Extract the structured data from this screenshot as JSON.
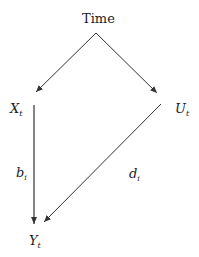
{
  "diagram": {
    "nodes": [
      {
        "id": "time",
        "label": "Time"
      },
      {
        "id": "x",
        "label": "X",
        "sub": "t"
      },
      {
        "id": "u",
        "label": "U",
        "sub": "t"
      },
      {
        "id": "y",
        "label": "Y",
        "sub": "t"
      }
    ],
    "edges": [
      {
        "from": "time",
        "to": "x",
        "label": ""
      },
      {
        "from": "time",
        "to": "u",
        "label": ""
      },
      {
        "from": "x",
        "to": "y",
        "label": "b",
        "label_sub": "i"
      },
      {
        "from": "u",
        "to": "y",
        "label": "d",
        "label_sub": "i"
      }
    ],
    "colors": {
      "line": "#333333",
      "background": "#ffffff"
    }
  }
}
